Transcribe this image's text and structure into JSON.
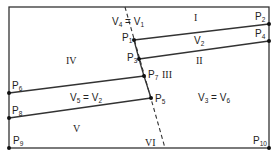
{
  "diagram": {
    "frame": {
      "x1": 9,
      "y1": 7,
      "x2": 269,
      "y2": 148
    },
    "colors": {
      "line": "#333333",
      "point": "#111111",
      "text": "#222222"
    },
    "dashed_line": {
      "x1": 125,
      "y1": 7,
      "x2": 165,
      "y2": 148
    },
    "points": [
      {
        "id": "P1",
        "name": "P",
        "sub": "1",
        "x": 134,
        "y": 40,
        "lx": 122,
        "ly": 33
      },
      {
        "id": "P2",
        "name": "P",
        "sub": "2",
        "x": 269,
        "y": 24,
        "lx": 255,
        "ly": 12
      },
      {
        "id": "P3",
        "name": "P",
        "sub": "3",
        "x": 139,
        "y": 59,
        "lx": 127,
        "ly": 53
      },
      {
        "id": "P4",
        "name": "P",
        "sub": "4",
        "x": 269,
        "y": 41,
        "lx": 255,
        "ly": 29
      },
      {
        "id": "P5",
        "name": "P",
        "sub": "5",
        "x": 151,
        "y": 98,
        "lx": 155,
        "ly": 94
      },
      {
        "id": "P6",
        "name": "P",
        "sub": "6",
        "x": 9,
        "y": 93,
        "lx": 12,
        "ly": 81
      },
      {
        "id": "P7",
        "name": "P",
        "sub": "7",
        "x": 144,
        "y": 76,
        "lx": 148,
        "ly": 70
      },
      {
        "id": "P8",
        "name": "P",
        "sub": "8",
        "x": 9,
        "y": 118,
        "lx": 12,
        "ly": 106
      },
      {
        "id": "P9",
        "name": "P",
        "sub": "9",
        "x": 9,
        "y": 148,
        "lx": 13,
        "ly": 136
      },
      {
        "id": "P10",
        "name": "P",
        "sub": "10",
        "x": 269,
        "y": 148,
        "lx": 253,
        "ly": 136
      }
    ],
    "segments": [
      {
        "from": "P1",
        "to": "P2"
      },
      {
        "from": "P3",
        "to": "P4"
      },
      {
        "from": "P6",
        "to": "P7"
      },
      {
        "from": "P8",
        "to": "P5"
      },
      {
        "from": "P1",
        "to": "P3"
      },
      {
        "from": "P3",
        "to": "P7"
      },
      {
        "from": "P7",
        "to": "P5"
      }
    ],
    "regions": [
      {
        "id": "I",
        "label": "I",
        "x": 194,
        "y": 13
      },
      {
        "id": "II",
        "label": "II",
        "x": 196,
        "y": 56
      },
      {
        "id": "III",
        "label": "III",
        "x": 162,
        "y": 70
      },
      {
        "id": "IV",
        "label": "IV",
        "x": 66,
        "y": 56
      },
      {
        "id": "V",
        "label": "V",
        "x": 73,
        "y": 124
      },
      {
        "id": "VI",
        "label": "VI",
        "x": 145,
        "y": 138
      }
    ],
    "equations": [
      {
        "id": "eq-v4-v1",
        "a": "V",
        "a_sub": "4",
        "b": "V",
        "b_sub": "1",
        "x": 112,
        "y": 17
      },
      {
        "id": "eq-v2",
        "a": "V",
        "a_sub": "2",
        "x": 194,
        "y": 36
      },
      {
        "id": "eq-v5-v2",
        "a": "V",
        "a_sub": "5",
        "b": "V",
        "b_sub": "2",
        "x": 70,
        "y": 93
      },
      {
        "id": "eq-v3-v6",
        "a": "V",
        "a_sub": "3",
        "b": "V",
        "b_sub": "6",
        "x": 198,
        "y": 93
      }
    ],
    "equals_sign": "="
  }
}
